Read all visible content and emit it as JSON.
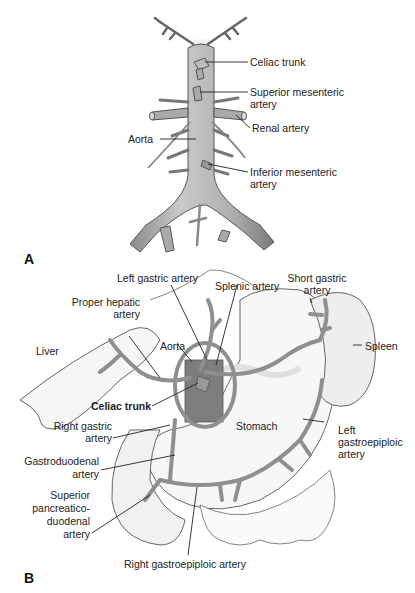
{
  "figure": {
    "panels": [
      {
        "id": "A",
        "letter": "A",
        "labels": {
          "celiac_trunk": "Celiac trunk",
          "superior_mesenteric_1": "Superior mesenteric",
          "superior_mesenteric_2": "artery",
          "renal_artery": "Renal artery",
          "aorta": "Aorta",
          "inferior_mesenteric_1": "Inferior mesenteric",
          "inferior_mesenteric_2": "artery"
        }
      },
      {
        "id": "B",
        "letter": "B",
        "labels": {
          "left_gastric": "Left gastric artery",
          "splenic": "Splenic artery",
          "short_gastric_1": "Short gastric",
          "short_gastric_2": "artery",
          "proper_hepatic_1": "Proper hepatic",
          "proper_hepatic_2": "artery",
          "liver": "Liver",
          "aorta": "Aorta",
          "spleen": "Spleen",
          "celiac_trunk": "Celiac trunk",
          "right_gastric_1": "Right gastric",
          "right_gastric_2": "artery",
          "stomach": "Stomach",
          "left_gastroepiploic_1": "Left",
          "left_gastroepiploic_2": "gastroepiploic",
          "left_gastroepiploic_3": "artery",
          "gastroduodenal_1": "Gastroduodenal",
          "gastroduodenal_2": "artery",
          "sup_pancreatico_1": "Superior",
          "sup_pancreatico_2": "pancreatico-",
          "sup_pancreatico_3": "duodenal",
          "sup_pancreatico_4": "artery",
          "right_gastroepiploic": "Right gastroepiploic artery"
        }
      }
    ],
    "colors": {
      "vessel": "#9a9a9a",
      "vessel_edge": "#555555",
      "organ_fill": "#f4f4f4",
      "aorta_dark": "#7d7d7d",
      "leader": "#222222"
    }
  }
}
